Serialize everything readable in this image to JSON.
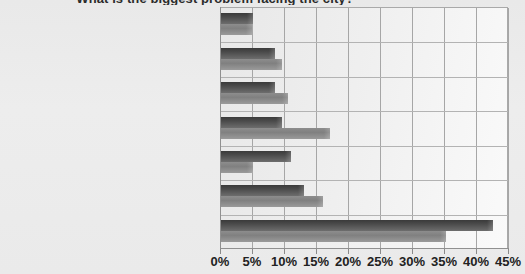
{
  "chart_data": {
    "type": "bar",
    "orientation": "horizontal",
    "title": "What is the biggest problem facing the city?",
    "xlabel": "",
    "ylabel": "",
    "xlim": [
      0,
      45
    ],
    "grid": true,
    "legend": "none",
    "categories": [
      "Governance/city council",
      "Reputation/media coverage",
      "Litter/dirty Streets",
      "Dereliction/poverty/unemployment",
      "People",
      "Nothing",
      "Crime/antisocial behaviour"
    ],
    "series": [
      {
        "name": "Series 1",
        "values": [
          5.0,
          8.5,
          8.5,
          9.5,
          11.0,
          13.0,
          42.5
        ]
      },
      {
        "name": "Series 2",
        "values": [
          4.8,
          9.5,
          10.5,
          17.0,
          5.0,
          16.0,
          35.2
        ]
      }
    ],
    "ticks": [
      "0%",
      "5%",
      "10%",
      "15%",
      "20%",
      "25%",
      "30%",
      "35%",
      "40%",
      "45%"
    ],
    "tick_values": [
      0,
      5,
      10,
      15,
      20,
      25,
      30,
      35,
      40,
      45
    ],
    "colors": {
      "series1": "#4a4a4a",
      "series2": "#8d8d8d",
      "plot_background": "#efefef",
      "grid": "#a6a6a6",
      "axis": "#909090",
      "text": "#1f1f1f"
    }
  }
}
